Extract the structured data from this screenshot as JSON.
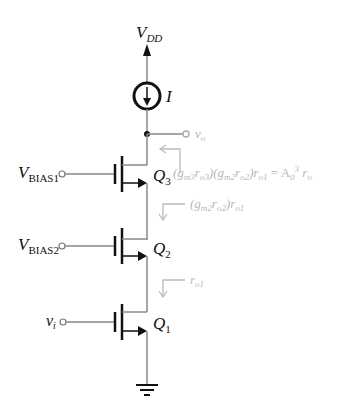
{
  "diagram": {
    "type": "circuit-schematic",
    "supply": {
      "label": "V",
      "subscript": "DD"
    },
    "current_source": {
      "label": "I"
    },
    "output": {
      "label": "v",
      "subscript": "o"
    },
    "transistors": [
      {
        "id": "Q3",
        "label": "Q",
        "subscript": "3",
        "gate_label": "V",
        "gate_subscript": "BIAS1"
      },
      {
        "id": "Q2",
        "label": "Q",
        "subscript": "2",
        "gate_label": "V",
        "gate_subscript": "BIAS2"
      },
      {
        "id": "Q1",
        "label": "Q",
        "subscript": "1",
        "gate_label": "v",
        "gate_subscript": "i"
      }
    ],
    "annotations": [
      {
        "id": "r_q3",
        "text": "(g",
        "full": "(gm3ro3)(gm2ro2)ro1 = A0^3 ro"
      },
      {
        "id": "r_q2",
        "full": "(gm2ro2)ro1"
      },
      {
        "id": "r_q1",
        "full": "ro1"
      }
    ],
    "colors": {
      "wire": "#888888",
      "device": "#111111",
      "annotation": "#b8b8b8"
    }
  }
}
